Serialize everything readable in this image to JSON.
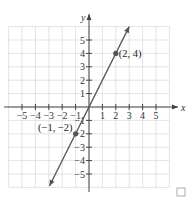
{
  "chart_data": {
    "type": "line",
    "title": "",
    "xlabel": "x",
    "ylabel": "y",
    "xlim": [
      -6,
      6
    ],
    "ylim": [
      -6,
      6
    ],
    "grid": true,
    "x_ticks": [
      -5,
      -4,
      -3,
      -2,
      -1,
      1,
      2,
      3,
      4,
      5
    ],
    "y_ticks": [
      -5,
      -4,
      -3,
      -2,
      -1,
      1,
      2,
      3,
      4,
      5
    ],
    "x_tick_labels": [
      "−5",
      "−4",
      "−3",
      "−2",
      "−1",
      "1",
      "2",
      "3",
      "4",
      "5"
    ],
    "y_tick_labels": [
      "−5",
      "−4",
      "−3",
      "−2",
      "−1",
      "1",
      "2",
      "3",
      "4",
      "5"
    ],
    "series": [
      {
        "name": "y = 2x",
        "equation": "y = 2x",
        "slope": 2,
        "intercept": 0,
        "x": [
          -3,
          3
        ],
        "y": [
          -6,
          6
        ],
        "color": "#555555",
        "arrows": "both"
      }
    ],
    "points": [
      {
        "x": 2,
        "y": 4,
        "label": "(2, 4)"
      },
      {
        "x": -1,
        "y": -2,
        "label": "(−1, −2)"
      }
    ],
    "annotations": [
      "(2, 4)",
      "(−1, −2)"
    ]
  },
  "colors": {
    "grid": "#dcdcdc",
    "axis": "#444444",
    "line": "#555555",
    "point": "#555555"
  }
}
